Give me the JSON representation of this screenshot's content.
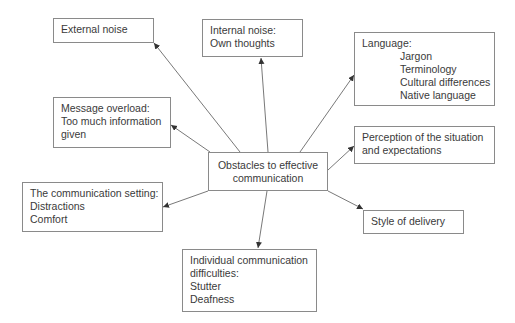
{
  "diagram": {
    "center": {
      "lines": [
        "Obstacles to effective",
        "communication"
      ]
    },
    "nodes": {
      "external_noise": {
        "lines": [
          "External noise"
        ]
      },
      "internal_noise": {
        "lines": [
          "Internal noise:",
          "Own thoughts"
        ]
      },
      "language": {
        "title": "Language:",
        "items": [
          "Jargon",
          "Terminology",
          "Cultural differences",
          "Native language"
        ]
      },
      "message_overload": {
        "lines": [
          "Message overload:",
          "Too much information",
          "given"
        ]
      },
      "perception": {
        "lines": [
          "Perception of the situation",
          "and expectations"
        ]
      },
      "communication_setting": {
        "lines": [
          "The communication setting:",
          "Distractions",
          "Comfort"
        ]
      },
      "style_of_delivery": {
        "lines": [
          "Style of delivery"
        ]
      },
      "individual_difficulties": {
        "lines": [
          "Individual communication",
          "difficulties:",
          "Stutter",
          "Deafness"
        ]
      }
    },
    "colors": {
      "border": "#8a8a8a",
      "text": "#3a3a3a",
      "arrow": "#555555"
    }
  }
}
